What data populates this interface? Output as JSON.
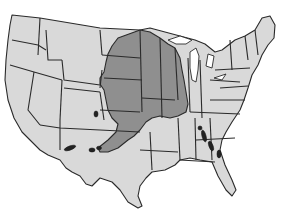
{
  "map": {
    "subject": "Contiguous United States",
    "style": "grayscale choropleth",
    "colors": {
      "background": "#ffffff",
      "unshaded_state": "#d9d9d9",
      "shaded_region": "#8f8f8f",
      "border": "#2a2a2a",
      "water_blotch": "#222222"
    },
    "shaded_states": [
      "North Dakota (east)",
      "South Dakota (east)",
      "Minnesota",
      "Nebraska (east)",
      "Iowa",
      "Wisconsin (west)",
      "Kansas (east)",
      "Missouri",
      "Illinois (west)",
      "Oklahoma (northeast)",
      "Arkansas (north)"
    ],
    "features": [
      "state boundaries",
      "Great Lakes",
      "dark reservoir blotches in Texas/Oklahoma and Alabama/Georgia"
    ]
  }
}
